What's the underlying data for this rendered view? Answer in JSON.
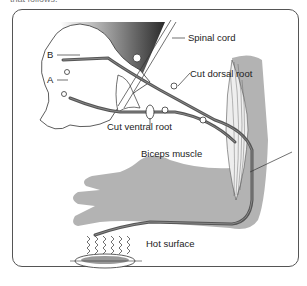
{
  "caption_fragment": "that follows.",
  "diagram": {
    "labels": {
      "spinal_cord": "Spinal cord",
      "b": "B",
      "a": "A",
      "cut_dorsal_root": "Cut dorsal root",
      "cut_ventral_root": "Cut ventral root",
      "biceps_muscle": "Biceps muscle",
      "hot_surface": "Hot surface"
    },
    "colors": {
      "frame": "#555555",
      "arm": "#b3b3b3",
      "nerve": "#666666",
      "cord_gradient_dark": "#333333"
    }
  }
}
